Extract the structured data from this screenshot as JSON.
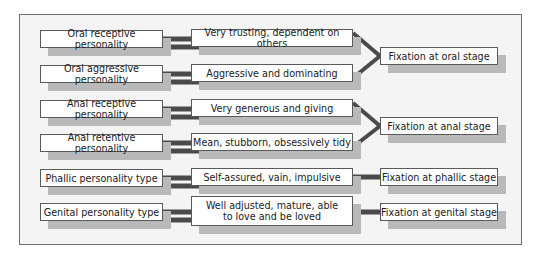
{
  "diagram": {
    "personalities": [
      {
        "label": "Oral receptive personality",
        "trait": "Very trusting, dependent on others",
        "stage_group": 0
      },
      {
        "label": "Oral aggressive personality",
        "trait": "Aggressive and dominating",
        "stage_group": 0
      },
      {
        "label": "Anal receptive personality",
        "trait": "Very generous and giving",
        "stage_group": 1
      },
      {
        "label": "Anal retentive personality",
        "trait": "Mean, stubborn, obsessively tidy",
        "stage_group": 1
      },
      {
        "label": "Phallic personality type",
        "trait": "Self-assured, vain, impulsive",
        "stage_group": 2
      },
      {
        "label": "Genital personality type",
        "trait": "Well adjusted, mature, able\nto love and be loved",
        "stage_group": 3
      }
    ],
    "fixations": [
      {
        "label": "Fixation at oral stage"
      },
      {
        "label": "Fixation at anal stage"
      },
      {
        "label": "Fixation at phallic stage"
      },
      {
        "label": "Fixation at genital stage"
      }
    ],
    "colors": {
      "connector": "#4a4a4a",
      "shadow": "#b9b9b9",
      "frame_bg": "#f4f4f4",
      "box_border": "#5a5a5a"
    }
  }
}
